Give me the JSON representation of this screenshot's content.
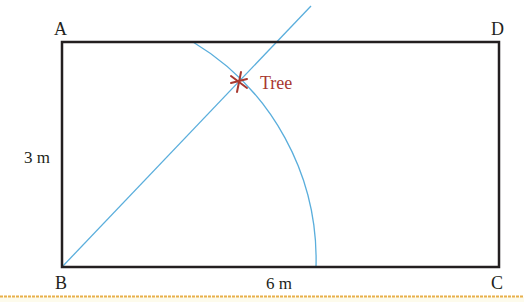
{
  "diagram": {
    "vertices": {
      "A": {
        "label": "A",
        "x": 62,
        "y": 42
      },
      "B": {
        "label": "B",
        "x": 62,
        "y": 267
      },
      "C": {
        "label": "C",
        "x": 499,
        "y": 267
      },
      "D": {
        "label": "D",
        "x": 499,
        "y": 42
      }
    },
    "dimensions": {
      "side_ab": "3 m",
      "side_bc": "6 m"
    },
    "marker": {
      "label": "Tree",
      "x": 239,
      "y": 82
    },
    "colors": {
      "rectangle": "#231f20",
      "construction": "#5aaedc",
      "marker": "#a8382f",
      "marker_label": "#a8382f",
      "divider": "#e8b04a",
      "footer_bg": "#fdfbec"
    }
  }
}
